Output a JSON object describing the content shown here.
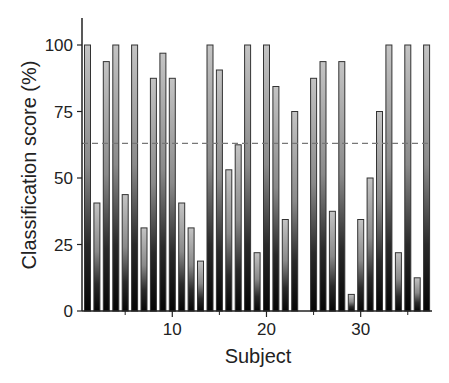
{
  "chart_data": {
    "type": "bar",
    "title": "",
    "xlabel": "Subject",
    "ylabel": "Classification score (%)",
    "ylim": [
      0,
      110
    ],
    "xlim": [
      0.5,
      37.5
    ],
    "yticks": [
      0,
      25,
      50,
      75,
      100
    ],
    "xticks_labeled": [
      10,
      20,
      30
    ],
    "xticks_minor": [
      5,
      15,
      25,
      35
    ],
    "grid": false,
    "legend": null,
    "reference_line": {
      "value": 63,
      "style": "dashed",
      "color": "#777777"
    },
    "categories": [
      1,
      2,
      3,
      4,
      5,
      6,
      7,
      8,
      9,
      10,
      11,
      12,
      13,
      14,
      15,
      16,
      17,
      18,
      19,
      20,
      21,
      22,
      23,
      24,
      25,
      26,
      27,
      28,
      29,
      30,
      31,
      32,
      33,
      34,
      35,
      36,
      37
    ],
    "values": [
      100,
      40.6,
      93.75,
      100,
      43.75,
      100,
      31.25,
      87.5,
      96.9,
      87.5,
      40.6,
      31.25,
      18.75,
      100,
      90.6,
      53.1,
      62.5,
      100,
      21.9,
      100,
      84.4,
      34.4,
      75,
      0,
      87.5,
      93.75,
      37.5,
      93.75,
      6.25,
      34.4,
      50,
      75,
      100,
      21.9,
      100,
      12.5,
      100
    ],
    "bar_style": {
      "gradient_top": "#c4c4c4",
      "gradient_mid": "#6a6a6a",
      "gradient_bottom": "#050505",
      "outline": "#333333"
    }
  }
}
